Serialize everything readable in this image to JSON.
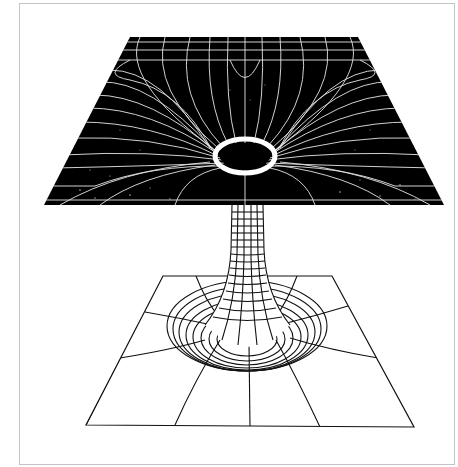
{
  "figure": {
    "colors": {
      "background": "#ffffff",
      "frame_border": "#c4c4c4",
      "upper_sheet_fill": "#000000",
      "upper_sheet_lines": "#e8e8e8",
      "lower_sheet_fill": "#ffffff",
      "lower_sheet_lines": "#111111"
    },
    "upper_sheet": {
      "label": ""
    },
    "lower_sheet": {
      "label": ""
    },
    "throat": {
      "label": ""
    }
  }
}
